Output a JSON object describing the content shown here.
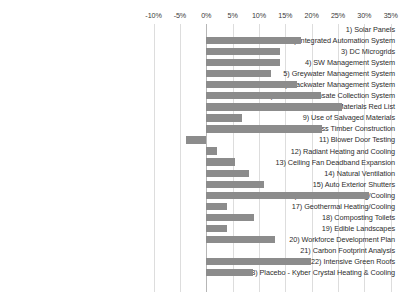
{
  "chart": {
    "type": "bar",
    "orientation": "horizontal",
    "title": "",
    "xlabel": "",
    "ylabel": "",
    "grid": true,
    "legend": false
  },
  "axis": {
    "tick_labels": [
      "-10%",
      "-5%",
      "0%",
      "5%",
      "10%",
      "15%",
      "20%",
      "25%",
      "30%",
      "35%"
    ],
    "tick_values": [
      -10,
      -5,
      0,
      5,
      10,
      15,
      20,
      25,
      30,
      35
    ],
    "xmin": -12,
    "xmax": 36
  },
  "colors": {
    "bar": "#8c8c8c",
    "gridline": "#dddddd",
    "zero_line": "#b6b6b6",
    "text": "#2d2d2d",
    "background": "#ffffff"
  },
  "chart_data": {
    "type": "bar",
    "orientation": "horizontal",
    "title": "",
    "xlabel": "",
    "ylabel": "",
    "xlim": [
      -12,
      36
    ],
    "grid": true,
    "legend": null,
    "units": "percent",
    "categories": [
      "1) Solar Panels",
      "2) Integrated Automation System",
      "3) DC Microgrids",
      "4) SW Management System",
      "5) Greywater Management System",
      "6) Blackwater Management System",
      "7) HVAC Condensate Collection System",
      "8) Living Building Materials Red List",
      "9) Use of Salvaged Materials",
      "10) Heavy Mass Timber Construction",
      "11) Blower Door Testing",
      "12) Radiant Heating and Cooling",
      "13) Ceiling Fan Deadband Expansion",
      "14) Natural Ventilation",
      "15) Auto Exterior Shutters",
      "16) Chilled Beam Heating/Cooling",
      "17) Geothermal Heating/Cooling",
      "18) Composting Toilets",
      "19) Edible Landscapes",
      "20) Workforce Development Plan",
      "21) Carbon Footprint Analysis",
      "22) Intensive Green Roofs",
      "23) Placebo - Kyber Crystal Heating & Cooling"
    ],
    "values": [
      0.0,
      18.0,
      14.0,
      14.0,
      12.2,
      17.2,
      21.7,
      25.8,
      6.8,
      22.0,
      -3.9,
      2.0,
      5.5,
      8.2,
      11.0,
      30.9,
      4.0,
      9.0,
      4.0,
      13.0,
      0.0,
      19.8,
      8.8
    ]
  }
}
